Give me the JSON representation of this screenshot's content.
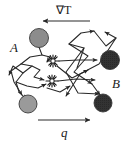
{
  "figure": {
    "background_color": "#ffffff",
    "width": 131,
    "height": 143,
    "labels": {
      "gradient": "∇T",
      "flux": "q",
      "region_a": "A",
      "region_b": "B"
    },
    "arrows": {
      "gradient_arrow": {
        "name": "temperature-gradient-arrow",
        "direction": "left",
        "x_start": 90,
        "x_end": 40,
        "y": 21
      },
      "flux_arrow": {
        "name": "heat-flux-arrow",
        "direction": "right",
        "x_start": 38,
        "x_end": 93,
        "y": 120
      }
    },
    "label_positions": {
      "gradient": {
        "x": 56,
        "y": 14
      },
      "flux": {
        "x": 61,
        "y": 137
      },
      "region_a": {
        "x": 10,
        "y": 52
      },
      "region_b": {
        "x": 112,
        "y": 88
      }
    },
    "scatterers": [
      {
        "name": "scatterer-top-left",
        "cx": 39,
        "cy": 38,
        "r": 9.5,
        "fill": "#8c8c8c"
      },
      {
        "name": "scatterer-top-right",
        "cx": 110,
        "cy": 60,
        "r": 9.5,
        "fill": "#333333"
      },
      {
        "name": "scatterer-bottom-left",
        "cx": 28,
        "cy": 104,
        "r": 9.0,
        "fill": "#9a9a9a"
      },
      {
        "name": "scatterer-bottom-right",
        "cx": 103,
        "cy": 103,
        "r": 9.0,
        "fill": "#3c3c3c"
      }
    ],
    "scattering_centers": [
      {
        "name": "scattering-center-upper",
        "cx": 53,
        "cy": 61,
        "spikes": 10,
        "r_inner": 2.2,
        "r_outer": 6.0
      },
      {
        "name": "scattering-center-lower",
        "cx": 52,
        "cy": 81,
        "spikes": 10,
        "r_inner": 2.2,
        "r_outer": 6.0
      }
    ],
    "trajectories": [
      {
        "name": "trajectory-a-upper-zigzag",
        "points": "39,47 42,55 30,57 21,64 32,66 23,73 16,82 19,92 26,99"
      },
      {
        "name": "trajectory-a-fan-left",
        "points": "21,64 11,71 14,82 22,95"
      },
      {
        "name": "trajectory-a-to-center",
        "points": "42,55 50,57 47,62"
      },
      {
        "name": "trajectory-left-mid",
        "points": "32,66 40,70 34,77 44,80"
      },
      {
        "name": "trajectory-lower-left",
        "points": "16,82 27,86 38,88 46,84"
      },
      {
        "name": "trajectory-center-right-1",
        "points": "59,61 78,60 97,60"
      },
      {
        "name": "trajectory-center-right-2",
        "points": "58,81 76,79 95,80"
      },
      {
        "name": "trajectory-b-upper",
        "points": "77,68 84,48 69,44 81,33 94,31"
      },
      {
        "name": "trajectory-b-peak",
        "points": "94,31 106,46 116,38 105,32"
      },
      {
        "name": "trajectory-b-long-1",
        "points": "69,44 88,56 74,72 92,84"
      },
      {
        "name": "trajectory-b-long-2",
        "points": "116,38 99,64 80,74 66,96"
      },
      {
        "name": "trajectory-b-long-3",
        "points": "84,48 66,72 78,93 99,94"
      },
      {
        "name": "trajectory-b-down",
        "points": "92,84 100,95"
      },
      {
        "name": "trajectory-center-to-b",
        "points": "57,66 72,78 88,70"
      }
    ]
  }
}
